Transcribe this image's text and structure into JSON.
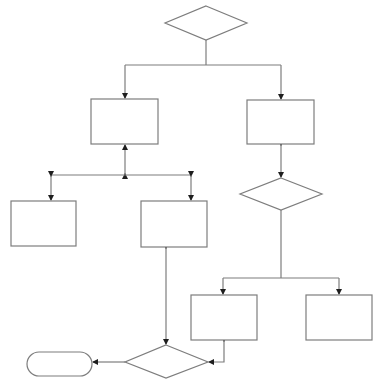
{
  "diagram": {
    "type": "flowchart",
    "colors": {
      "stroke": "#7d7d7d",
      "arrowhead": "#1e1e1e",
      "fill": "#ffffff",
      "background": "#ffffff"
    },
    "nodes": [
      {
        "id": "decision-top",
        "shape": "diamond",
        "label": "",
        "cx": 206,
        "cy": 23,
        "w": 82,
        "h": 34
      },
      {
        "id": "process-left",
        "shape": "rect",
        "label": "",
        "x": 91,
        "y": 99,
        "w": 67,
        "h": 45
      },
      {
        "id": "process-right",
        "shape": "rect",
        "label": "",
        "x": 247,
        "y": 100,
        "w": 67,
        "h": 44
      },
      {
        "id": "decision-right",
        "shape": "diamond",
        "label": "",
        "cx": 281,
        "cy": 194,
        "w": 82,
        "h": 32
      },
      {
        "id": "process-far-left",
        "shape": "rect",
        "label": "",
        "x": 11,
        "y": 201,
        "w": 65,
        "h": 45
      },
      {
        "id": "process-middle",
        "shape": "rect",
        "label": "",
        "x": 141,
        "y": 201,
        "w": 66,
        "h": 46
      },
      {
        "id": "process-bottom-left",
        "shape": "rect",
        "label": "",
        "x": 191,
        "y": 295,
        "w": 66,
        "h": 45
      },
      {
        "id": "process-bottom-right",
        "shape": "rect",
        "label": "",
        "x": 306,
        "y": 295,
        "w": 66,
        "h": 45
      },
      {
        "id": "decision-bottom",
        "shape": "diamond",
        "label": "",
        "cx": 166,
        "cy": 362,
        "w": 83,
        "h": 33
      },
      {
        "id": "terminal-end",
        "shape": "terminal",
        "label": "",
        "x": 27,
        "y": 352,
        "w": 65,
        "h": 24
      }
    ],
    "edges": [
      {
        "from": "decision-top",
        "to": "process-left",
        "direction": "forward"
      },
      {
        "from": "decision-top",
        "to": "process-right",
        "direction": "forward"
      },
      {
        "from": "process-left",
        "to": "process-far-left",
        "direction": "bidirectional"
      },
      {
        "from": "process-left",
        "to": "process-middle",
        "direction": "bidirectional"
      },
      {
        "from": "process-right",
        "to": "decision-right",
        "direction": "bidirectional"
      },
      {
        "from": "decision-right",
        "to": "process-bottom-left",
        "direction": "forward"
      },
      {
        "from": "decision-right",
        "to": "process-bottom-right",
        "direction": "forward"
      },
      {
        "from": "process-middle",
        "to": "decision-bottom",
        "direction": "bidirectional"
      },
      {
        "from": "process-bottom-left",
        "to": "decision-bottom",
        "direction": "bidirectional"
      },
      {
        "from": "decision-bottom",
        "to": "terminal-end",
        "direction": "forward"
      }
    ]
  }
}
